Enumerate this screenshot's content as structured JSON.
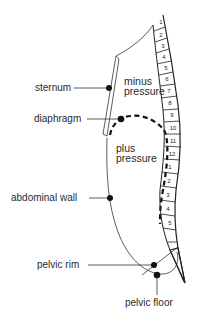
{
  "diagram": {
    "type": "anatomical cross-section (sagittal) of trunk showing pressure zones",
    "labels": {
      "sternum": "sternum",
      "diaphragm": "diaphragm",
      "abdominal_wall": "abdominal wall",
      "pelvic_rim": "pelvic rim",
      "pelvic_floor": "pelvic floor"
    },
    "zones": {
      "upper_line1": "minus",
      "upper_line2": "pressure",
      "lower_line1": "plus",
      "lower_line2": "pressure"
    },
    "vertebrae": {
      "thoracic": [
        "1",
        "2",
        "3",
        "4",
        "5",
        "6",
        "7",
        "8",
        "9",
        "10",
        "11",
        "12"
      ],
      "lumbar": [
        "1",
        "2",
        "3",
        "4",
        "5"
      ]
    },
    "colors": {
      "line": "#222222",
      "background": "#ffffff"
    }
  }
}
